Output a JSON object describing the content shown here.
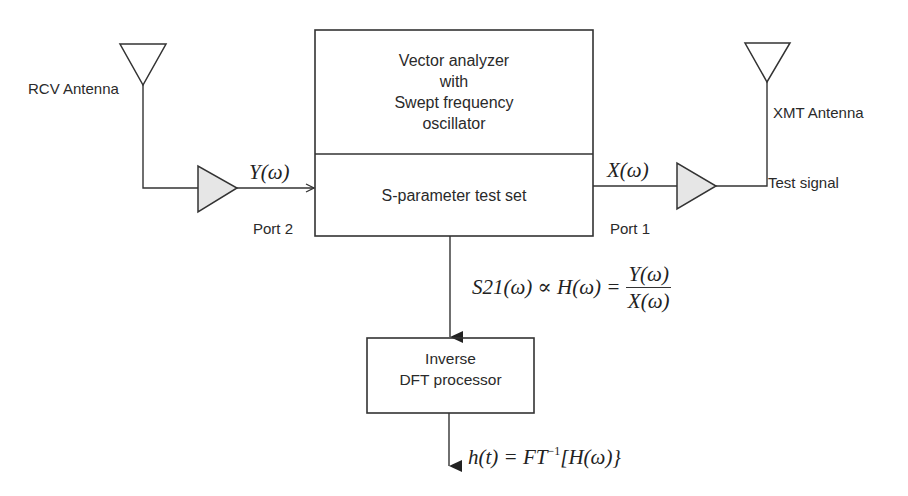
{
  "diagram": {
    "blocks": {
      "analyzer": {
        "lines": [
          "Vector analyzer",
          "with",
          "Swept frequency",
          "oscillator"
        ]
      },
      "test_set": {
        "label": "S-parameter test set"
      },
      "dft": {
        "lines": [
          "Inverse",
          "DFT processor"
        ]
      }
    },
    "antennas": {
      "rcv": {
        "label": "RCV Antenna"
      },
      "xmt": {
        "label": "XMT Antenna"
      }
    },
    "ports": {
      "left": "Port 2",
      "right": "Port 1"
    },
    "signals": {
      "received": "Y(ω)",
      "transmitted": "X(ω)",
      "test_signal": "Test signal"
    },
    "equations": {
      "transfer": {
        "lhs": "S21(ω) ∝ H(ω) =",
        "numerator": "Y(ω)",
        "denominator": "X(ω)"
      },
      "impulse": {
        "prefix": "h(t) = FT",
        "exponent": "−1",
        "suffix": "[H(ω)}"
      }
    },
    "colors": {
      "line": "#333333",
      "amplifier_fill": "#e6e6e6",
      "background": "#ffffff"
    }
  }
}
